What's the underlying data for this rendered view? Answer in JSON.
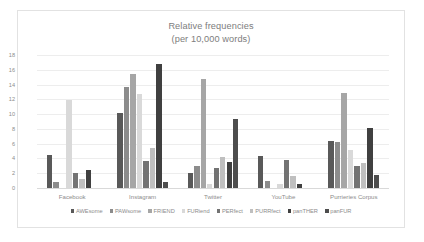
{
  "chart_data": {
    "type": "bar",
    "title": "Relative frequencies",
    "subtitle": "(per 10,000 words)",
    "xlabel": "",
    "ylabel": "",
    "ylim": [
      0,
      18
    ],
    "yticks": [
      0,
      2,
      4,
      6,
      8,
      10,
      12,
      14,
      16,
      18
    ],
    "grid": true,
    "legend_position": "bottom",
    "categories": [
      "Facebook",
      "Instagram",
      "Twitter",
      "YouTube",
      "Purrieries Corpus"
    ],
    "series": [
      {
        "name": "AWEsome",
        "color": "#595959",
        "values": [
          4.5,
          10.1,
          2.0,
          4.4,
          6.4
        ]
      },
      {
        "name": "PAWsome",
        "color": "#8c8c8c",
        "values": [
          0.8,
          13.7,
          3.0,
          0.9,
          6.2
        ]
      },
      {
        "name": "FRIEND",
        "color": "#a6a6a6",
        "values": [
          0.0,
          15.4,
          14.8,
          0.0,
          12.9
        ]
      },
      {
        "name": "FURiend",
        "color": "#d9d9d9",
        "values": [
          11.9,
          12.7,
          0.5,
          0.5,
          5.1
        ]
      },
      {
        "name": "PERfect",
        "color": "#737373",
        "values": [
          2.0,
          3.7,
          2.7,
          3.8,
          3.0
        ]
      },
      {
        "name": "PURRfect",
        "color": "#bfbfbf",
        "values": [
          1.2,
          5.4,
          4.2,
          1.6,
          3.4
        ]
      },
      {
        "name": "panTHER",
        "color": "#404040",
        "values": [
          2.5,
          16.8,
          3.5,
          0.5,
          8.1
        ]
      },
      {
        "name": "panFUR",
        "color": "#4d4d4d",
        "values": [
          0.0,
          0.8,
          9.3,
          0.0,
          1.7
        ]
      }
    ]
  }
}
